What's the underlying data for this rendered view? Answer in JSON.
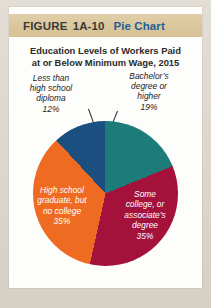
{
  "figure": {
    "label": "FIGURE",
    "number": "1A-10",
    "type": "Pie Chart"
  },
  "subtitle_line1": "Education Levels of Workers Paid",
  "subtitle_line2": "at or Below Minimum Wage, 2015",
  "labels": {
    "less_than_hs": {
      "line1": "Less than",
      "line2": "high school",
      "line3": "diploma",
      "value": "12%"
    },
    "bachelors": {
      "line1": "Bachelor’s",
      "line2": "degree or",
      "line3": "higher",
      "value": "19%"
    },
    "hs_graduate": {
      "line1": "High school",
      "line2": "graduate, but",
      "line3": "no college",
      "value": "35%"
    },
    "some_college": {
      "line1": "Some",
      "line2": "college, or",
      "line3": "associate’s",
      "line4": "degree",
      "value": "35%"
    }
  },
  "colors": {
    "bachelors": "#1d7b79",
    "some_college": "#a4113a",
    "hs_graduate": "#ee6b21",
    "less_than_hs": "#1a4f80",
    "band": "#dbc79c",
    "type_text": "#1f5f99",
    "card": "#fdfdfb",
    "page": "#ddd7cd"
  },
  "chart_data": {
    "type": "pie",
    "title": "Education Levels of Workers Paid at or Below Minimum Wage, 2015",
    "labels": [
      "Bachelor’s degree or higher",
      "Some college, or associate’s degree",
      "High school graduate, but no college",
      "Less than high school diploma"
    ],
    "values": [
      19,
      35,
      35,
      12
    ],
    "value_labels": [
      "19%",
      "35%",
      "35%",
      "12%"
    ],
    "colors": [
      "#1d7b79",
      "#a4113a",
      "#ee6b21",
      "#1a4f80"
    ],
    "units": "percent",
    "start_angle_deg": 0,
    "direction": "clockwise",
    "legend": "none",
    "label_placement": [
      "outside",
      "inside",
      "inside",
      "outside"
    ],
    "total": 101
  }
}
